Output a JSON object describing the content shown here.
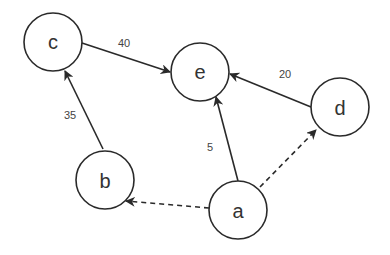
{
  "diagram": {
    "type": "directed-graph",
    "nodes": [
      {
        "id": "c",
        "label": "c"
      },
      {
        "id": "e",
        "label": "e"
      },
      {
        "id": "d",
        "label": "d"
      },
      {
        "id": "b",
        "label": "b"
      },
      {
        "id": "a",
        "label": "a"
      }
    ],
    "edges": [
      {
        "from": "c",
        "to": "e",
        "label": "40",
        "style": "solid"
      },
      {
        "from": "d",
        "to": "e",
        "label": "20",
        "style": "solid"
      },
      {
        "from": "b",
        "to": "c",
        "label": "35",
        "style": "solid"
      },
      {
        "from": "a",
        "to": "e",
        "label": "5",
        "style": "solid"
      },
      {
        "from": "a",
        "to": "b",
        "label": "",
        "style": "dashed"
      },
      {
        "from": "a",
        "to": "d",
        "label": "",
        "style": "dashed"
      }
    ],
    "colors": {
      "stroke": "#2a2a2a",
      "text": "#333333",
      "background": "#ffffff"
    }
  }
}
